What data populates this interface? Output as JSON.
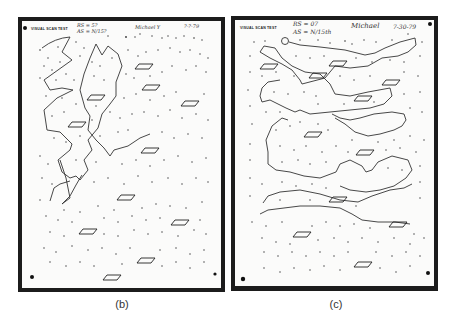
{
  "figure": {
    "panels": [
      {
        "id": "b",
        "caption": "(b)",
        "sheet_title": "VISUAL SCAN TEST",
        "annotations": {
          "score_line_1": "RS = 5?",
          "score_line_2": "AS = N/15?",
          "name": "Michael Y",
          "date": "?-?-79"
        }
      },
      {
        "id": "c",
        "caption": "(c)",
        "sheet_title": "VISUAL SCAN TEST",
        "annotations": {
          "score_line_1": "RS = 07",
          "score_line_2": "AS = N/15th",
          "name": "Michael",
          "date": "7-30-79"
        }
      }
    ],
    "colors": {
      "frame": "#1c1c1c",
      "paper": "#fbfbfa",
      "ink": "#333333"
    }
  }
}
